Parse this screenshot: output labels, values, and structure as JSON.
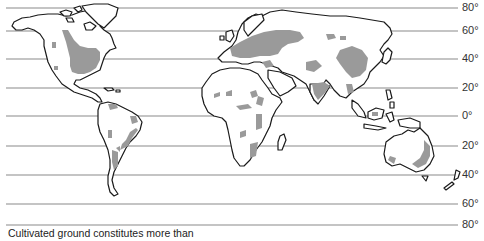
{
  "map": {
    "title": "World map: cultivated land",
    "projection": "world (latitude lines only)",
    "colors": {
      "land_outline": "#1a1a1a",
      "cultivated_fill": "#9a9a9a",
      "latitude_line": "#8a8a8a",
      "background": "#ffffff"
    },
    "latitude_lines": [
      {
        "label": "80°",
        "value": "80",
        "y": 8
      },
      {
        "label": "60°",
        "value": "60",
        "y": 31
      },
      {
        "label": "40°",
        "value": "40",
        "y": 59
      },
      {
        "label": "20°",
        "value": "20",
        "y": 88
      },
      {
        "label": "0°",
        "value": "0",
        "y": 116
      },
      {
        "label": "20°",
        "value": "20",
        "y": 146
      },
      {
        "label": "40°",
        "value": "40",
        "y": 175
      },
      {
        "label": "60°",
        "value": "60",
        "y": 204
      },
      {
        "label": "80°",
        "value": "80",
        "y": 225
      }
    ],
    "legend": {
      "caption": "Cultivated ground constitutes more than"
    },
    "regions": [
      "North America",
      "South America",
      "Europe",
      "Africa",
      "Asia",
      "Australia",
      "New Zealand"
    ]
  }
}
